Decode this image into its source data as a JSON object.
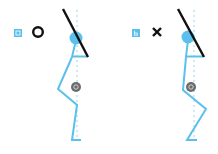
{
  "colors": {
    "body": "#5bc0eb",
    "dotted": "#bfe6f5",
    "bar": "#111111",
    "label_bg": "#5bc0eb",
    "marker": "#6b6b6b",
    "symbol": "#111111"
  },
  "panels": [
    {
      "id": "a",
      "label": "a",
      "symbol": "circle-correct",
      "symbol_meaning": "O",
      "marker_label": "c"
    },
    {
      "id": "b",
      "label": "b",
      "symbol": "cross-incorrect",
      "symbol_meaning": "X",
      "marker_label": "c"
    }
  ]
}
